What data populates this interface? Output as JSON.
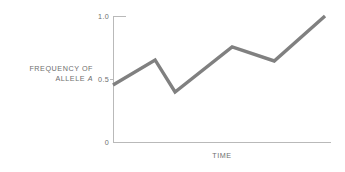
{
  "figure": {
    "background": "#ffffff",
    "line_color": "#808080",
    "axis_color": "#b9b9b9",
    "text_color": "#6e6e6e"
  },
  "axes": {
    "y_title_line1": "FREQUENCY OF",
    "y_title_line2": "ALLELE",
    "y_title_symbol": "A",
    "x_title": "TIME",
    "y_ticks": [
      "1.0",
      "0.5",
      "0"
    ]
  },
  "chart_data": {
    "type": "line",
    "title": "",
    "xlabel": "TIME",
    "ylabel": "FREQUENCY OF ALLELE A",
    "xlim": [
      0,
      1
    ],
    "ylim": [
      0,
      1
    ],
    "yticks": [
      0,
      0.5,
      1.0
    ],
    "ytick_labels": [
      "0",
      "0.5",
      "1.0"
    ],
    "xticks": [],
    "xtick_labels": [],
    "grid": false,
    "legend": null,
    "series": [
      {
        "name": "allele frequency",
        "color": "#808080",
        "x": [
          0.0,
          0.194,
          0.286,
          0.549,
          0.743,
          0.977
        ],
        "y": [
          0.452,
          0.651,
          0.397,
          0.754,
          0.643,
          1.0
        ]
      }
    ]
  }
}
